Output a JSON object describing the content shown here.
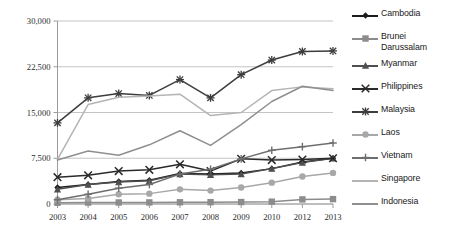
{
  "chart_data": {
    "type": "line",
    "title": "",
    "xlabel": "",
    "ylabel": "",
    "ylim": [
      0,
      30000
    ],
    "ytick_labels": [
      "0",
      "7,500",
      "15,000",
      "22,500",
      "30,000"
    ],
    "ytick_values": [
      0,
      7500,
      15000,
      22500,
      30000
    ],
    "grid": true,
    "legend_position": "right",
    "categories": [
      "2003",
      "2004",
      "2005",
      "2006",
      "2007",
      "2008",
      "2009",
      "2010",
      "2012",
      "2013"
    ],
    "series": [
      {
        "name": "Cambodia",
        "marker": "diamond",
        "color": "#1c1c1c",
        "values": [
          2700,
          3200,
          3700,
          3900,
          5000,
          4900,
          5100,
          5800,
          6900,
          7500
        ]
      },
      {
        "name": "Brunei Darussalam",
        "marker": "square",
        "color": "#8c8c8c",
        "values": [
          200,
          230,
          250,
          260,
          280,
          300,
          320,
          380,
          750,
          800
        ]
      },
      {
        "name": "Myanmar",
        "marker": "triangle",
        "color": "#4f4f4f",
        "values": [
          2400,
          3200,
          3600,
          3800,
          4900,
          4800,
          4900,
          5800,
          6800,
          7500
        ]
      },
      {
        "name": "Philippines",
        "marker": "x",
        "color": "#2a2a2a",
        "values": [
          4400,
          4700,
          5400,
          5600,
          6500,
          5400,
          7400,
          7200,
          7300,
          7500
        ]
      },
      {
        "name": "Malaysia",
        "marker": "asterisk",
        "color": "#3d3d3d",
        "values": [
          13300,
          17400,
          18100,
          17800,
          20400,
          17400,
          21200,
          23600,
          25000,
          25100
        ]
      },
      {
        "name": "Laos",
        "marker": "circle",
        "color": "#a8a8a8",
        "values": [
          700,
          900,
          1600,
          1700,
          2400,
          2200,
          2700,
          3500,
          4500,
          5100
        ]
      },
      {
        "name": "Vietnam",
        "marker": "plus",
        "color": "#6e6e6e",
        "values": [
          700,
          1600,
          2600,
          3200,
          4900,
          5700,
          7400,
          8800,
          9400,
          10000
        ]
      },
      {
        "name": "Singapore",
        "marker": "none",
        "color": "#b4b4b4",
        "values": [
          7300,
          16300,
          17500,
          17700,
          18000,
          14500,
          15000,
          18600,
          19200,
          18900
        ]
      },
      {
        "name": "Indonesia",
        "marker": "none",
        "color": "#8f8f8f",
        "values": [
          7200,
          8700,
          8000,
          9700,
          12000,
          9600,
          13000,
          16800,
          19300,
          18600
        ]
      }
    ]
  },
  "legend": {
    "items": [
      {
        "label": "Cambodia",
        "marker": "diamond-marker",
        "color": "#1c1c1c"
      },
      {
        "label": "Brunei Darussalam",
        "marker": "square-marker",
        "color": "#8c8c8c"
      },
      {
        "label": "Myanmar",
        "marker": "triangle-marker",
        "color": "#4f4f4f"
      },
      {
        "label": "Philippines",
        "marker": "x-marker",
        "color": "#2a2a2a"
      },
      {
        "label": "Malaysia",
        "marker": "asterisk-marker",
        "color": "#3d3d3d"
      },
      {
        "label": "Laos",
        "marker": "circle-marker",
        "color": "#a8a8a8"
      },
      {
        "label": "Vietnam",
        "marker": "plus-marker",
        "color": "#6e6e6e"
      },
      {
        "label": "Singapore",
        "marker": "none",
        "color": "#b4b4b4"
      },
      {
        "label": "Indonesia",
        "marker": "none",
        "color": "#8f8f8f"
      }
    ]
  },
  "axes": {
    "gridline_color": "#bdbdbd",
    "axis_color": "#9a9a9a"
  }
}
